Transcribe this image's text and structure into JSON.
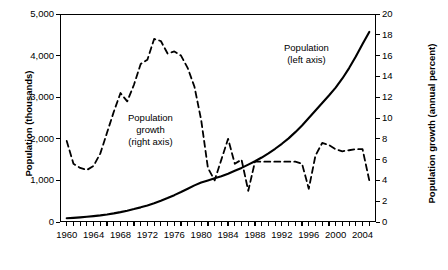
{
  "chart_data": {
    "type": "line",
    "title": "",
    "xlabel": "",
    "ylabel": "Population (thousands)",
    "ylabel_right": "Population growth (annual percent)",
    "xlim": [
      1959,
      2006
    ],
    "ylim": [
      0,
      5000
    ],
    "ylim_right": [
      0,
      20
    ],
    "grid": false,
    "legend_position": "inside-plot",
    "x_ticks": [
      "1960",
      "1964",
      "1968",
      "1972",
      "1976",
      "1980",
      "1984",
      "1988",
      "1992",
      "1996",
      "2000",
      "2004"
    ],
    "y_ticks_left": [
      "0",
      "1,000",
      "2,000",
      "3,000",
      "4,000",
      "5,000"
    ],
    "y_ticks_right": [
      "0",
      "2",
      "4",
      "6",
      "8",
      "10",
      "12",
      "14",
      "16",
      "18",
      "20"
    ],
    "annotations": [
      {
        "text_line1": "Population",
        "text_line2": "(left axis)"
      },
      {
        "text_line1": "Population",
        "text_line2": "growth",
        "text_line3": "(right axis)"
      }
    ],
    "series": [
      {
        "name": "Population (left axis)",
        "axis": "left",
        "style": "solid",
        "units": "thousands",
        "x": [
          1960,
          1961,
          1962,
          1963,
          1964,
          1965,
          1966,
          1967,
          1968,
          1969,
          1970,
          1971,
          1972,
          1973,
          1974,
          1975,
          1976,
          1977,
          1978,
          1979,
          1980,
          1981,
          1982,
          1983,
          1984,
          1985,
          1986,
          1987,
          1988,
          1989,
          1990,
          1991,
          1992,
          1993,
          1994,
          1995,
          1996,
          1997,
          1998,
          1999,
          2000,
          2001,
          2002,
          2003,
          2004,
          2005
        ],
        "values": [
          90,
          100,
          112,
          126,
          142,
          160,
          182,
          208,
          238,
          272,
          310,
          352,
          398,
          450,
          510,
          575,
          645,
          720,
          800,
          880,
          950,
          1000,
          1050,
          1100,
          1160,
          1230,
          1300,
          1380,
          1460,
          1550,
          1650,
          1760,
          1880,
          2010,
          2160,
          2320,
          2500,
          2680,
          2860,
          3040,
          3230,
          3450,
          3700,
          3980,
          4280,
          4570
        ]
      },
      {
        "name": "Population growth (right axis)",
        "axis": "right",
        "style": "dashed",
        "units": "annual percent",
        "x": [
          1960,
          1961,
          1962,
          1963,
          1964,
          1965,
          1966,
          1967,
          1968,
          1969,
          1970,
          1971,
          1972,
          1973,
          1974,
          1975,
          1976,
          1977,
          1978,
          1979,
          1980,
          1981,
          1982,
          1983,
          1984,
          1985,
          1986,
          1987,
          1988,
          1989,
          1990,
          1991,
          1992,
          1993,
          1994,
          1995,
          1996,
          1997,
          1998,
          1999,
          2000,
          2001,
          2002,
          2003,
          2004,
          2005
        ],
        "values": [
          7.8,
          5.6,
          5.2,
          5.0,
          5.4,
          6.6,
          8.6,
          10.6,
          12.4,
          11.6,
          13.2,
          15.2,
          15.6,
          17.6,
          17.4,
          16.2,
          16.4,
          16.0,
          14.8,
          13.0,
          9.8,
          5.2,
          4.0,
          6.0,
          8.0,
          5.6,
          6.0,
          3.0,
          5.8,
          5.8,
          5.8,
          5.8,
          5.8,
          5.8,
          5.8,
          5.6,
          3.2,
          6.4,
          7.6,
          7.4,
          7.0,
          6.8,
          6.9,
          7.0,
          7.0,
          4.0
        ]
      }
    ]
  }
}
